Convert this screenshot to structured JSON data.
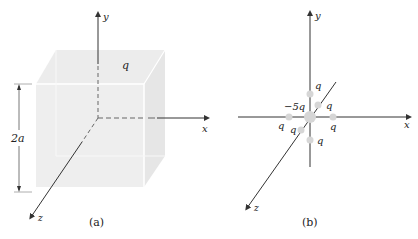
{
  "figure": {
    "panel_a": {
      "caption": "(a)",
      "axes": {
        "x": "x",
        "y": "y",
        "z": "z"
      },
      "charge_label": "q",
      "dimension_label": "2a",
      "colors": {
        "cube_face": "#ececec",
        "cube_edge": "#ffffff",
        "axis": "#333333"
      }
    },
    "panel_b": {
      "caption": "(b)",
      "axes": {
        "x": "x",
        "y": "y",
        "z": "z"
      },
      "center_charge": "−5q",
      "charges": [
        {
          "position": "+y",
          "label": "q"
        },
        {
          "position": "-z (back)",
          "label": "q"
        },
        {
          "position": "-x",
          "label": "q"
        },
        {
          "position": "+z (front)",
          "label": "q"
        },
        {
          "position": "+x",
          "label": "q"
        },
        {
          "position": "-y",
          "label": "q"
        }
      ],
      "colors": {
        "charge_dot": "#d6d6d6",
        "axis": "#333333"
      }
    }
  }
}
